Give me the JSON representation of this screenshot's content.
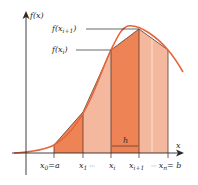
{
  "diagram": {
    "y_axis_label": "f(x)",
    "x_axis_label": "x",
    "annotations": {
      "f_xi1": {
        "base": "f(x",
        "sub": "i+1",
        "close": ")"
      },
      "f_xi": {
        "base": "f(x",
        "sub": "i",
        "close": ")"
      },
      "h": "h"
    },
    "x_ticks": [
      {
        "base": "x",
        "sub": "0",
        "rest": "=a"
      },
      {
        "base": "x",
        "sub": "1",
        "rest": " ···"
      },
      {
        "base": "x",
        "sub": "i",
        "rest": ""
      },
      {
        "base": "x",
        "sub": "i+1",
        "rest": ""
      },
      {
        "pre": "··· ",
        "base": "x",
        "sub": "n",
        "rest": "= b"
      }
    ],
    "colors": {
      "curve": "#e8643a",
      "dark_fill": "#ee8455",
      "light_fill": "#f4b89e",
      "axis": "#2a2a2a",
      "edge": "#5a3a2e"
    }
  }
}
